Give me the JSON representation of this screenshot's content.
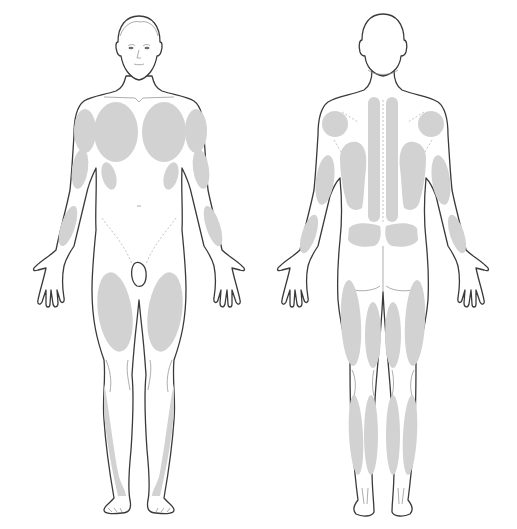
{
  "diagram": {
    "title": "",
    "type": "body-map",
    "views": [
      {
        "id": "front",
        "label": "",
        "center_x": 137
      },
      {
        "id": "back",
        "label": "",
        "center_x": 387
      }
    ],
    "shade_color": "#d2d2d2",
    "outline_color": "#3a3a3a",
    "front_regions": [
      {
        "name": "left-deltoid",
        "cx": 85,
        "cy": 131,
        "rx": 12,
        "ry": 22
      },
      {
        "name": "right-deltoid",
        "cx": 196,
        "cy": 131,
        "rx": 12,
        "ry": 22
      },
      {
        "name": "left-pectoral",
        "cx": 115,
        "cy": 132,
        "rx": 22,
        "ry": 31
      },
      {
        "name": "right-pectoral",
        "cx": 165,
        "cy": 132,
        "rx": 22,
        "ry": 31
      },
      {
        "name": "left-serratus",
        "cx": 109,
        "cy": 176,
        "rx": 8,
        "ry": 15
      },
      {
        "name": "right-serratus",
        "cx": 171,
        "cy": 176,
        "rx": 8,
        "ry": 15
      },
      {
        "name": "left-biceps",
        "cx": 80,
        "cy": 169,
        "rx": 8,
        "ry": 20
      },
      {
        "name": "right-biceps",
        "cx": 201,
        "cy": 169,
        "rx": 8,
        "ry": 20
      },
      {
        "name": "left-forearm",
        "cx": 68,
        "cy": 226,
        "rx": 8,
        "ry": 21
      },
      {
        "name": "right-forearm",
        "cx": 213,
        "cy": 226,
        "rx": 8,
        "ry": 21
      },
      {
        "name": "left-quadriceps",
        "cx": 115,
        "cy": 311,
        "rx": 18,
        "ry": 40
      },
      {
        "name": "right-quadriceps",
        "cx": 165,
        "cy": 311,
        "rx": 18,
        "ry": 40
      },
      {
        "name": "left-tibialis",
        "cx": 111,
        "cy": 436,
        "rx": 8,
        "ry": 50
      },
      {
        "name": "right-tibialis",
        "cx": 168,
        "cy": 436,
        "rx": 8,
        "ry": 50
      }
    ],
    "back_regions": [
      {
        "name": "left-trapezius-upper",
        "cx": 334,
        "cy": 124,
        "rx": 13,
        "ry": 12
      },
      {
        "name": "right-trapezius-upper",
        "cx": 431,
        "cy": 124,
        "rx": 13,
        "ry": 12
      },
      {
        "name": "left-erector-spinae",
        "cx": 374,
        "cy": 160,
        "rx": 6,
        "ry": 62
      },
      {
        "name": "right-erector-spinae",
        "cx": 392,
        "cy": 160,
        "rx": 6,
        "ry": 62
      },
      {
        "name": "left-latissimus",
        "cx": 355,
        "cy": 175,
        "rx": 14,
        "ry": 35
      },
      {
        "name": "right-latissimus",
        "cx": 411,
        "cy": 175,
        "rx": 14,
        "ry": 35
      },
      {
        "name": "left-triceps",
        "cx": 325,
        "cy": 180,
        "rx": 9,
        "ry": 25
      },
      {
        "name": "right-triceps",
        "cx": 440,
        "cy": 180,
        "rx": 9,
        "ry": 25
      },
      {
        "name": "left-lower-back",
        "cx": 365,
        "cy": 235,
        "rx": 17,
        "ry": 11
      },
      {
        "name": "right-lower-back",
        "cx": 401,
        "cy": 235,
        "rx": 17,
        "ry": 11
      },
      {
        "name": "left-forearm-back",
        "cx": 309,
        "cy": 234,
        "rx": 7,
        "ry": 20
      },
      {
        "name": "right-forearm-back",
        "cx": 456,
        "cy": 234,
        "rx": 7,
        "ry": 20
      },
      {
        "name": "left-hamstring-lateral",
        "cx": 351,
        "cy": 323,
        "rx": 10,
        "ry": 44
      },
      {
        "name": "left-hamstring-medial",
        "cx": 372,
        "cy": 335,
        "rx": 8,
        "ry": 34
      },
      {
        "name": "right-hamstring-medial",
        "cx": 393,
        "cy": 335,
        "rx": 8,
        "ry": 34
      },
      {
        "name": "right-hamstring-lateral",
        "cx": 414,
        "cy": 323,
        "rx": 10,
        "ry": 44
      },
      {
        "name": "left-gastrocnemius-lateral",
        "cx": 355,
        "cy": 434,
        "rx": 8,
        "ry": 38
      },
      {
        "name": "left-gastrocnemius-medial",
        "cx": 371,
        "cy": 434,
        "rx": 8,
        "ry": 38
      },
      {
        "name": "right-gastrocnemius-medial",
        "cx": 393,
        "cy": 434,
        "rx": 8,
        "ry": 38
      },
      {
        "name": "right-gastrocnemius-lateral",
        "cx": 411,
        "cy": 434,
        "rx": 8,
        "ry": 38
      }
    ]
  }
}
